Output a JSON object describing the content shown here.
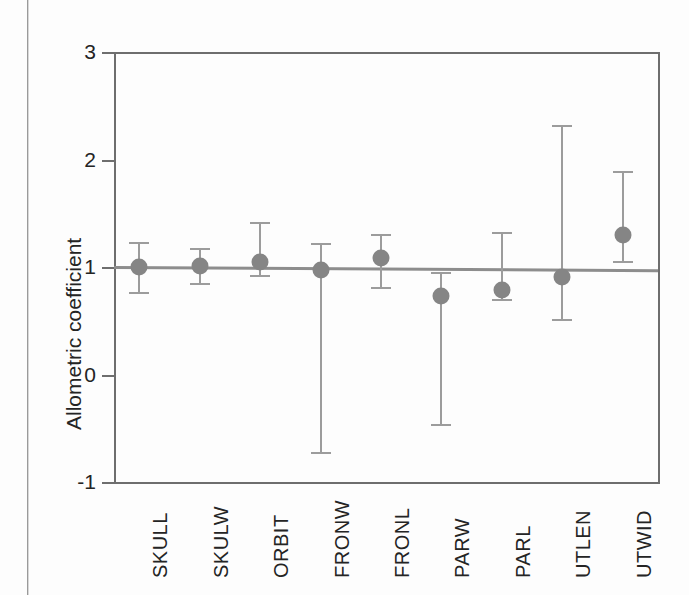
{
  "chart_data": {
    "type": "scatter",
    "title": "",
    "xlabel": "",
    "ylabel": "Allometric coefficient",
    "ylim": [
      -1,
      3
    ],
    "yticks": [
      3,
      2,
      1,
      0,
      -1
    ],
    "ytick_labels": [
      "3",
      "2",
      "1",
      "0",
      "-1"
    ],
    "grid": false,
    "legend": "none",
    "categories": [
      "SKULL",
      "SKULW",
      "ORBIT",
      "FRONW",
      "FRONL",
      "PARW",
      "PARL",
      "UTLEN",
      "UTWID"
    ],
    "values": [
      1.0,
      1.01,
      1.05,
      0.97,
      1.08,
      0.73,
      0.79,
      0.91,
      1.3
    ],
    "error_low": [
      0.77,
      0.85,
      0.93,
      -0.72,
      0.81,
      -0.46,
      0.7,
      0.52,
      1.06
    ],
    "error_high": [
      1.23,
      1.18,
      1.42,
      1.22,
      1.31,
      0.95,
      1.33,
      2.32,
      1.89
    ],
    "series": [
      {
        "name": "Allometric coefficient",
        "points": [
          {
            "category": "SKULL",
            "value": 1.0,
            "low": 0.77,
            "high": 1.23
          },
          {
            "category": "SKULW",
            "value": 1.01,
            "low": 0.85,
            "high": 1.18
          },
          {
            "category": "ORBIT",
            "value": 1.05,
            "low": 0.93,
            "high": 1.42
          },
          {
            "category": "FRONW",
            "value": 0.97,
            "low": -0.72,
            "high": 1.22
          },
          {
            "category": "FRONL",
            "value": 1.08,
            "low": 0.81,
            "high": 1.31
          },
          {
            "category": "PARW",
            "value": 0.73,
            "low": -0.46,
            "high": 0.95
          },
          {
            "category": "PARL",
            "value": 0.79,
            "low": 0.7,
            "high": 1.33
          },
          {
            "category": "UTLEN",
            "value": 0.91,
            "low": 0.52,
            "high": 2.32
          },
          {
            "category": "UTWID",
            "value": 1.3,
            "low": 1.06,
            "high": 1.89
          }
        ]
      }
    ],
    "reference_line": {
      "name": "isometry-line",
      "y_left": 1.0,
      "y_right": 0.97,
      "color": "#8d8d8d"
    },
    "colors": {
      "marker": "#858585",
      "errorbar": "#9c9c9c",
      "axis": "#6e6e6e",
      "text": "#242424",
      "background": "#fdfdfd"
    }
  }
}
